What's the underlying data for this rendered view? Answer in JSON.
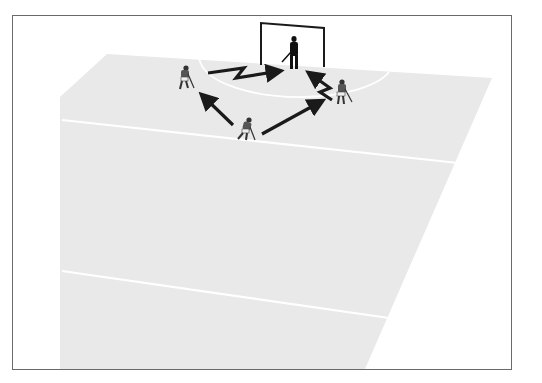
{
  "diagram": {
    "colors": {
      "background": "#ffffff",
      "frame": "#6a6a6a",
      "pitch": "#e9e9e9",
      "lines": "#ffffff",
      "arrows": "#1a1a1a",
      "goal": "#1a1a1a",
      "goalkeeper": "#111111",
      "players": "#4a4a4a"
    },
    "elements": {
      "goal": "goal",
      "goalkeeper": "goalkeeper",
      "players": [
        "player-left",
        "player-center",
        "player-right"
      ],
      "passes": [
        {
          "from": "player-center",
          "to": "player-left",
          "type": "straight"
        },
        {
          "from": "player-center",
          "to": "player-right",
          "type": "straight"
        },
        {
          "from": "player-left",
          "to": "goal",
          "type": "zigzag-shot"
        },
        {
          "from": "player-right",
          "to": "goal",
          "type": "zigzag-shot"
        }
      ]
    }
  }
}
